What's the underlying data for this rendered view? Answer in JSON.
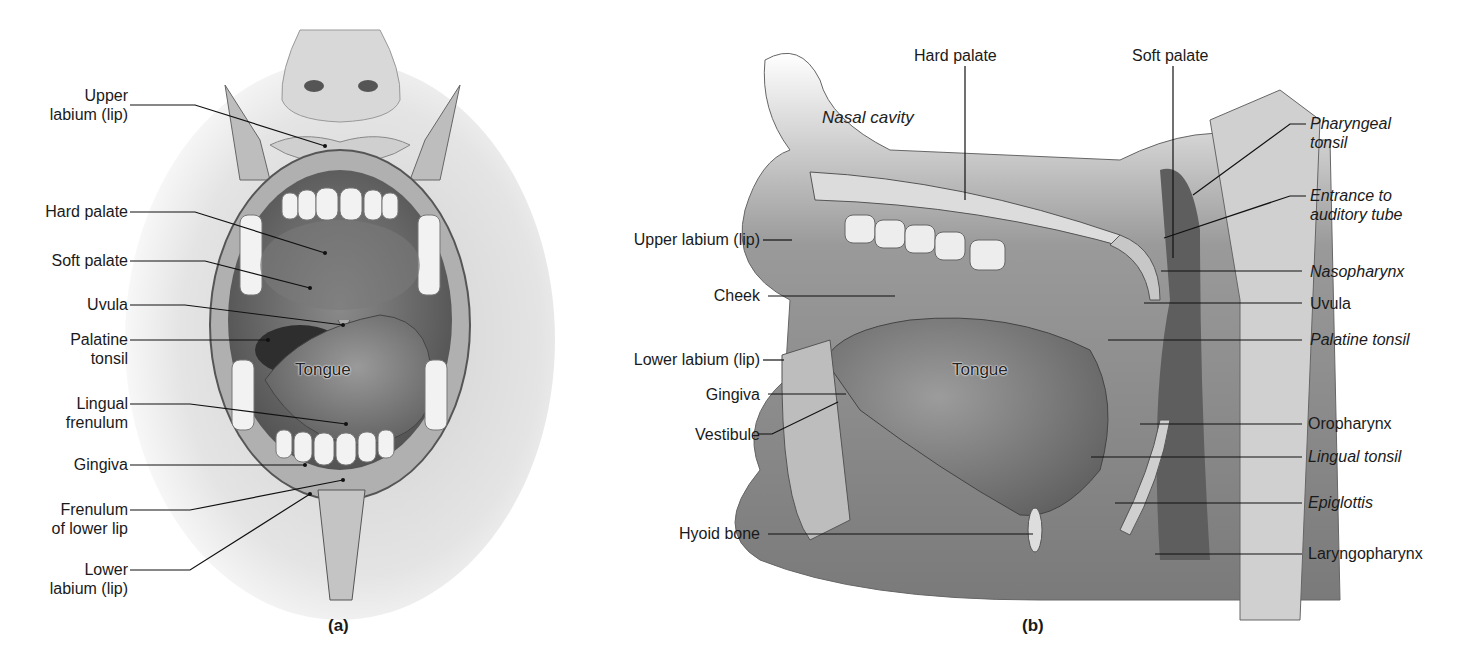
{
  "panel_a": {
    "caption": "(a)",
    "inner_label": "Tongue",
    "labels": [
      {
        "id": "upper-labium",
        "line1": "Upper",
        "line2": "labium (lip)"
      },
      {
        "id": "hard-palate",
        "line1": "Hard palate"
      },
      {
        "id": "soft-palate",
        "line1": "Soft palate"
      },
      {
        "id": "uvula",
        "line1": "Uvula"
      },
      {
        "id": "palatine-tonsil",
        "line1": "Palatine",
        "line2": "tonsil"
      },
      {
        "id": "lingual-frenulum",
        "line1": "Lingual",
        "line2": "frenulum"
      },
      {
        "id": "gingiva",
        "line1": "Gingiva"
      },
      {
        "id": "frenulum-lower-lip",
        "line1": "Frenulum",
        "line2": "of lower lip"
      },
      {
        "id": "lower-labium",
        "line1": "Lower",
        "line2": "labium (lip)"
      }
    ]
  },
  "panel_b": {
    "caption": "(b)",
    "inner_labels": {
      "nasal_cavity": "Nasal cavity",
      "tongue": "Tongue"
    },
    "top_labels": {
      "hard_palate": "Hard palate",
      "soft_palate": "Soft palate"
    },
    "left_labels": [
      {
        "id": "upper-labium",
        "text": "Upper labium (lip)"
      },
      {
        "id": "cheek",
        "text": "Cheek"
      },
      {
        "id": "lower-labium",
        "text": "Lower labium (lip)"
      },
      {
        "id": "gingiva",
        "text": "Gingiva"
      },
      {
        "id": "vestibule",
        "text": "Vestibule"
      },
      {
        "id": "hyoid-bone",
        "text": "Hyoid bone"
      }
    ],
    "right_labels": [
      {
        "id": "pharyngeal-tonsil",
        "line1": "Pharyngeal",
        "line2": "tonsil",
        "italic": true
      },
      {
        "id": "entrance-auditory-tube",
        "line1": "Entrance to",
        "line2": "auditory tube",
        "italic": true
      },
      {
        "id": "nasopharynx",
        "line1": "Nasopharynx",
        "italic": true
      },
      {
        "id": "uvula",
        "line1": "Uvula",
        "italic": false
      },
      {
        "id": "palatine-tonsil",
        "line1": "Palatine tonsil",
        "italic": true
      },
      {
        "id": "oropharynx",
        "line1": "Oropharynx",
        "italic": false
      },
      {
        "id": "lingual-tonsil",
        "line1": "Lingual tonsil",
        "italic": true
      },
      {
        "id": "epiglottis",
        "line1": "Epiglottis",
        "italic": true
      },
      {
        "id": "laryngopharynx",
        "line1": "Laryngopharynx",
        "italic": false
      }
    ]
  },
  "colors": {
    "background": "#ffffff",
    "text": "#1a1a1a",
    "tissue_dark": "#5a5a5a",
    "tissue_mid": "#8c8c8c",
    "tissue_light": "#c8c8c8",
    "teeth": "#f2f2f2"
  }
}
